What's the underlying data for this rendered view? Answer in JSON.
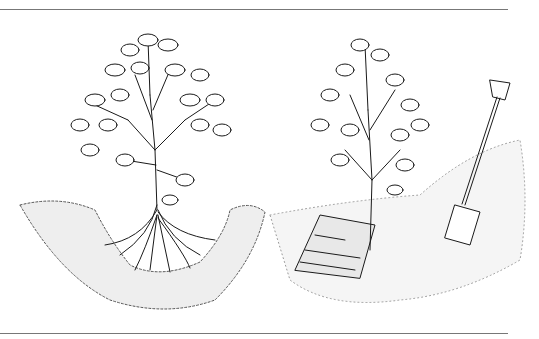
{
  "figure": {
    "panels": [
      {
        "id": "left",
        "subject": "shrub with exposed spreading roots set in a planting hole"
      },
      {
        "id": "right",
        "subject": "shrub planted beside newspaper mulch with a spade in soil"
      }
    ],
    "colors": {
      "ink": "#1a1a1a",
      "rule": "#777777",
      "background": "#ffffff"
    }
  }
}
